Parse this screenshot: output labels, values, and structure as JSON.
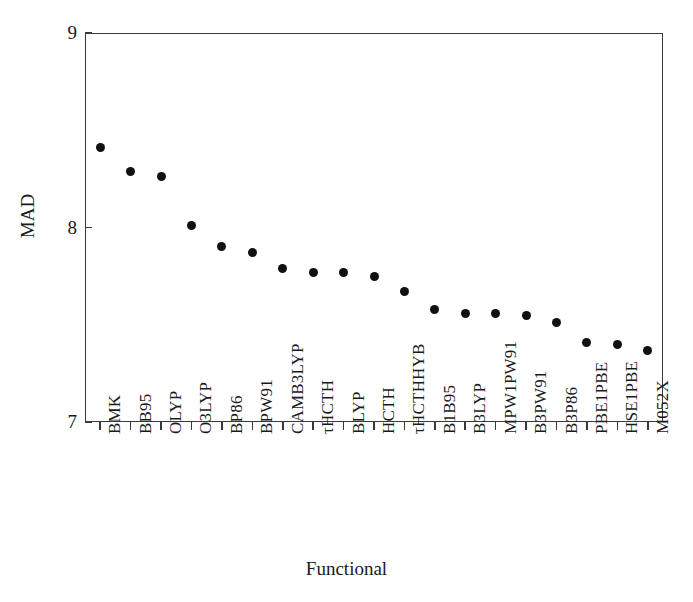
{
  "chart_data": {
    "type": "scatter",
    "title": "",
    "xlabel": "Functional",
    "ylabel": "MAD",
    "ylim": [
      7,
      9
    ],
    "yticks": [
      7,
      8,
      9
    ],
    "ytick_labels": [
      "7",
      "8",
      "9"
    ],
    "grid": false,
    "legend": null,
    "marker": "filled-circle",
    "marker_color": "#111111",
    "categories": [
      "BMK",
      "BB95",
      "OLYP",
      "O3LYP",
      "BP86",
      "BPW91",
      "CAMB3LYP",
      "τHCTH",
      "BLYP",
      "HCTH",
      "τHCTHHYB",
      "B1B95",
      "B3LYP",
      "MPW1PW91",
      "B3PW91",
      "B3P86",
      "PBE1PBE",
      "HSE1PBE",
      "M052X"
    ],
    "values": [
      8.41,
      8.29,
      8.26,
      8.01,
      7.9,
      7.87,
      7.79,
      7.77,
      7.77,
      7.75,
      7.67,
      7.58,
      7.56,
      7.56,
      7.55,
      7.51,
      7.41,
      7.4,
      7.37
    ]
  },
  "axes": {
    "frame_color": "#3a3a3a",
    "background": "#ffffff"
  }
}
